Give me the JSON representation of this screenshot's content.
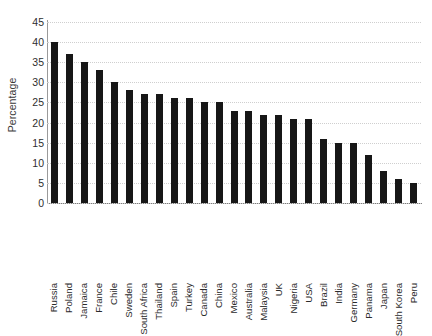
{
  "chart_data": {
    "type": "bar",
    "title": "",
    "subtitle": "",
    "xlabel": "",
    "ylabel": "Percentage",
    "ylim": [
      0,
      45
    ],
    "ytick_step": 5,
    "yticks": [
      0,
      5,
      10,
      15,
      20,
      25,
      30,
      35,
      40,
      45
    ],
    "grid": "horizontal-dotted",
    "legend": "none",
    "bar_color": "#171717",
    "categories": [
      "Russia",
      "Poland",
      "Jamaica",
      "France",
      "Chile",
      "Sweden",
      "South Africa",
      "Thailand",
      "Spain",
      "Turkey",
      "Canada",
      "China",
      "Mexico",
      "Australia",
      "Malaysia",
      "UK",
      "Nigeria",
      "USA",
      "Brazil",
      "India",
      "Germany",
      "Panama",
      "Japan",
      "South Korea",
      "Peru"
    ],
    "values": [
      40,
      37,
      35,
      33,
      30,
      28,
      27,
      27,
      26,
      26,
      25,
      25,
      23,
      23,
      22,
      22,
      21,
      21,
      16,
      15,
      15,
      12,
      8,
      6,
      5
    ],
    "series": [
      {
        "name": "Percentage",
        "values": [
          40,
          37,
          35,
          33,
          30,
          28,
          27,
          27,
          26,
          26,
          25,
          25,
          23,
          23,
          22,
          22,
          21,
          21,
          16,
          15,
          15,
          12,
          8,
          6,
          5
        ]
      }
    ],
    "annotations": []
  }
}
